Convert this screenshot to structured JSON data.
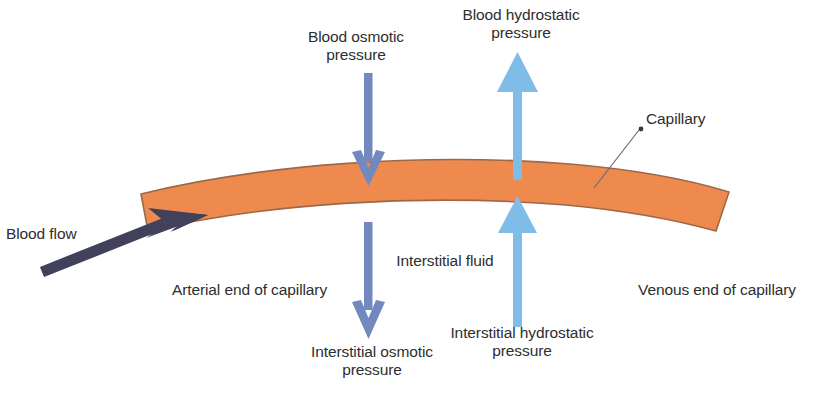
{
  "diagram": {
    "background_color": "#ffffff",
    "colors": {
      "capillary_fill": "#ee8a4e",
      "capillary_stroke": "#9c6848",
      "osmotic_arrow": "#7289c0",
      "hydrostatic_arrow": "#7fbde8",
      "blood_flow_arrow": "#41415c",
      "label_text": "#2e2e2e",
      "leader_line": "#6b6b6b"
    },
    "labels": {
      "blood_osmotic_pressure": "Blood osmotic\npressure",
      "blood_hydrostatic_pressure": "Blood hydrostatic\npressure",
      "capillary": "Capillary",
      "blood_flow": "Blood flow",
      "arterial_end": "Arterial end of capillary",
      "interstitial_fluid": "Interstitial fluid",
      "venous_end": "Venous end of capillary",
      "interstitial_osmotic_pressure": "Interstitial osmotic\npressure",
      "interstitial_hydrostatic_pressure": "Interstitial hydrostatic\npressure"
    },
    "arrows": [
      {
        "name": "blood-osmotic-arrow",
        "direction": "down",
        "color": "#7289c0",
        "head": "chevron",
        "position": "upper-left-inward"
      },
      {
        "name": "blood-hydrostatic-arrow",
        "direction": "up",
        "color": "#7fbde8",
        "head": "triangle",
        "position": "upper-right-outward"
      },
      {
        "name": "interstitial-osmotic-arrow",
        "direction": "down",
        "color": "#7289c0",
        "head": "chevron",
        "position": "lower-left-outward"
      },
      {
        "name": "interstitial-hydrostatic-arrow",
        "direction": "up",
        "color": "#7fbde8",
        "head": "triangle",
        "position": "lower-right-inward"
      },
      {
        "name": "blood-flow-arrow",
        "direction": "up-right",
        "color": "#41415c",
        "head": "barbed",
        "position": "left-entry"
      }
    ]
  }
}
